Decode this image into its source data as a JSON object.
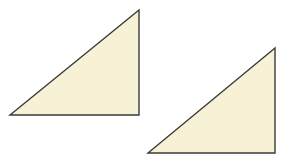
{
  "diagram": {
    "background": "#ffffff",
    "fill_color": "#f7f1d6",
    "stroke_color": "#3a3a3a",
    "stroke_width": 1.4,
    "shapes": [
      {
        "type": "right-triangle",
        "right_angle": "bottom-right",
        "points": [
          [
            139,
            10
          ],
          [
            10,
            115
          ],
          [
            139,
            115
          ]
        ]
      },
      {
        "type": "right-triangle",
        "right_angle": "bottom-right",
        "points": [
          [
            275,
            48
          ],
          [
            148,
            153
          ],
          [
            275,
            153
          ]
        ]
      }
    ]
  }
}
